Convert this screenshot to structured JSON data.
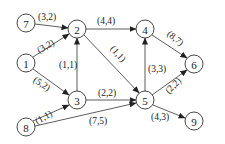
{
  "diagram": {
    "type": "directed-graph",
    "nodes": [
      {
        "id": "7",
        "label": "7",
        "x": 26,
        "y": 23
      },
      {
        "id": "1",
        "label": "1",
        "x": 26,
        "y": 63
      },
      {
        "id": "8",
        "label": "8",
        "x": 26,
        "y": 127
      },
      {
        "id": "2",
        "label": "2",
        "x": 77,
        "y": 29
      },
      {
        "id": "3",
        "label": "3",
        "x": 77,
        "y": 100
      },
      {
        "id": "4",
        "label": "4",
        "x": 145,
        "y": 29
      },
      {
        "id": "5",
        "label": "5",
        "x": 145,
        "y": 100
      },
      {
        "id": "6",
        "label": "6",
        "x": 194,
        "y": 64
      },
      {
        "id": "9",
        "label": "9",
        "x": 194,
        "y": 121
      }
    ],
    "edges": [
      {
        "from": "7",
        "to": "2",
        "label": "(3,2)"
      },
      {
        "from": "1",
        "to": "2",
        "label": "(3,2)"
      },
      {
        "from": "1",
        "to": "3",
        "label": "(5,2)"
      },
      {
        "from": "3",
        "to": "2",
        "label": "(1,1)"
      },
      {
        "from": "2",
        "to": "4",
        "label": "(4,4)"
      },
      {
        "from": "2",
        "to": "5",
        "label": "(1,1)"
      },
      {
        "from": "5",
        "to": "4",
        "label": "(3,3)"
      },
      {
        "from": "4",
        "to": "6",
        "label": "(8,7)"
      },
      {
        "from": "3",
        "to": "5",
        "label": "(2,2)"
      },
      {
        "from": "8",
        "to": "3",
        "label": "(1,1)"
      },
      {
        "from": "8",
        "to": "5",
        "label": "(7,5)"
      },
      {
        "from": "5",
        "to": "6",
        "label": "(2,2)"
      },
      {
        "from": "5",
        "to": "9",
        "label": "(4,3)"
      }
    ]
  }
}
